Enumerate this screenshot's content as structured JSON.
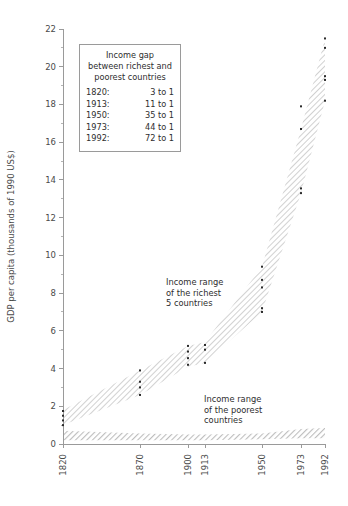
{
  "chart_data": {
    "type": "area",
    "title": "",
    "xlabel": "",
    "ylabel": "GDP per capita (thousands of 1990 US$)",
    "x": [
      1820,
      1870,
      1900,
      1913,
      1950,
      1973,
      1992
    ],
    "xtick_labels": [
      "1820",
      "1870",
      "1900",
      "1913",
      "1950",
      "1973",
      "1992"
    ],
    "ylim": [
      0,
      22
    ],
    "ytick_labels": [
      "0",
      "2",
      "4",
      "6",
      "8",
      "10",
      "12",
      "14",
      "16",
      "18",
      "20",
      "22"
    ],
    "ytick_values": [
      0,
      2,
      4,
      6,
      8,
      10,
      12,
      14,
      16,
      18,
      20,
      22
    ],
    "yminor_values": [
      1,
      3,
      5,
      7,
      9,
      11,
      13,
      15,
      17,
      19,
      21
    ],
    "grid": false,
    "legend_position": "none",
    "series": [
      {
        "name": "Income range of the richest 5 countries",
        "type": "band",
        "lower": [
          1.0,
          2.6,
          4.1,
          4.3,
          7.0,
          13.3,
          18.2
        ],
        "upper": [
          1.8,
          3.9,
          5.2,
          5.4,
          9.4,
          16.7,
          21.5
        ]
      },
      {
        "name": "Income range of the poorest countries",
        "type": "band",
        "lower": [
          0.2,
          0.2,
          0.2,
          0.2,
          0.25,
          0.3,
          0.3
        ],
        "upper": [
          0.7,
          0.55,
          0.5,
          0.5,
          0.55,
          0.8,
          0.85
        ]
      }
    ],
    "points": [
      {
        "x": 1820,
        "values": [
          1.0,
          1.25,
          1.5,
          1.75
        ]
      },
      {
        "x": 1870,
        "values": [
          2.6,
          3.0,
          3.3,
          3.9
        ]
      },
      {
        "x": 1900,
        "values": [
          4.2,
          4.55,
          4.9,
          5.2
        ]
      },
      {
        "x": 1913,
        "values": [
          4.3,
          5.0,
          5.25
        ]
      },
      {
        "x": 1950,
        "values": [
          7.0,
          7.2,
          8.3,
          8.7,
          9.4
        ]
      },
      {
        "x": 1973,
        "values": [
          13.3,
          13.55,
          16.7,
          17.9
        ]
      },
      {
        "x": 1992,
        "values": [
          18.2,
          19.3,
          19.5,
          21.0,
          21.5
        ]
      }
    ],
    "annotations": [
      {
        "name": "richest-band-label",
        "lines": [
          "Income range",
          "of the richest",
          "5 countries"
        ]
      },
      {
        "name": "poorest-band-label",
        "lines": [
          "Income range",
          "of the poorest",
          "countries"
        ]
      }
    ]
  },
  "legend_box": {
    "title_lines": [
      "Income gap",
      "between richest and",
      "poorest countries"
    ],
    "rows": [
      {
        "year": "1820:",
        "ratio": "3 to 1"
      },
      {
        "year": "1913:",
        "ratio": "11 to 1"
      },
      {
        "year": "1950:",
        "ratio": "35 to 1"
      },
      {
        "year": "1973:",
        "ratio": "44 to 1"
      },
      {
        "year": "1992:",
        "ratio": "72 to 1"
      }
    ]
  },
  "colors": {
    "axis": "#9a9a9a",
    "text": "#3a3a3a",
    "rich_band": "#d8d8d8",
    "poor_band": "#c9c9c9",
    "dot": "#2b2b2b",
    "background": "#ffffff"
  }
}
